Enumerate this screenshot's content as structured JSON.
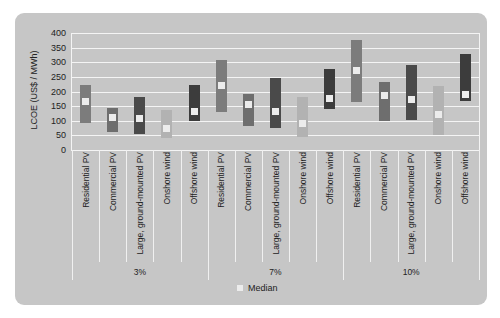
{
  "chart_data": {
    "type": "range-bar",
    "title": "",
    "ylabel": "LCOE (US$ / MWh)",
    "xlabel": "",
    "ylim": [
      0,
      400
    ],
    "yticks": [
      0,
      50,
      100,
      150,
      200,
      250,
      300,
      350,
      400
    ],
    "grid": true,
    "legend": {
      "position": "bottom",
      "entries": [
        "Median"
      ]
    },
    "groups": [
      "3%",
      "7%",
      "10%"
    ],
    "categories": [
      "Residential PV",
      "Commercial PV",
      "Large, ground-mounted PV",
      "Onshore wind",
      "Offshore wind"
    ],
    "colors": {
      "Residential PV": "#7c7c7c",
      "Commercial PV": "#6e6e6e",
      "Large, ground-mounted PV": "#4a4a4a",
      "Onshore wind": "#b2b2b2",
      "Offshore wind": "#3c3c3c",
      "median": "#ececec",
      "background": "#c6c6c6"
    },
    "series": [
      {
        "group": "3%",
        "category": "Residential PV",
        "min": 93,
        "max": 222,
        "median": 167
      },
      {
        "group": "3%",
        "category": "Commercial PV",
        "min": 63,
        "max": 142,
        "median": 110
      },
      {
        "group": "3%",
        "category": "Large, ground-mounted PV",
        "min": 55,
        "max": 181,
        "median": 108
      },
      {
        "group": "3%",
        "category": "Onshore wind",
        "min": 40,
        "max": 138,
        "median": 74
      },
      {
        "group": "3%",
        "category": "Offshore wind",
        "min": 99,
        "max": 222,
        "median": 133
      },
      {
        "group": "7%",
        "category": "Residential PV",
        "min": 131,
        "max": 307,
        "median": 222
      },
      {
        "group": "7%",
        "category": "Commercial PV",
        "min": 81,
        "max": 193,
        "median": 154
      },
      {
        "group": "7%",
        "category": "Large, ground-mounted PV",
        "min": 76,
        "max": 245,
        "median": 133
      },
      {
        "group": "7%",
        "category": "Onshore wind",
        "min": 45,
        "max": 182,
        "median": 89
      },
      {
        "group": "7%",
        "category": "Offshore wind",
        "min": 139,
        "max": 276,
        "median": 177
      },
      {
        "group": "10%",
        "category": "Residential PV",
        "min": 163,
        "max": 376,
        "median": 271
      },
      {
        "group": "10%",
        "category": "Commercial PV",
        "min": 98,
        "max": 234,
        "median": 188
      },
      {
        "group": "10%",
        "category": "Large, ground-mounted PV",
        "min": 103,
        "max": 290,
        "median": 171
      },
      {
        "group": "10%",
        "category": "Onshore wind",
        "min": 51,
        "max": 219,
        "median": 120
      },
      {
        "group": "10%",
        "category": "Offshore wind",
        "min": 169,
        "max": 327,
        "median": 190
      }
    ]
  }
}
